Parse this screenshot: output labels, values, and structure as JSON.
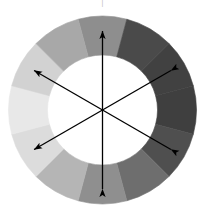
{
  "figure": {
    "top_mark": "|",
    "background_color": "#ffffff",
    "center": {
      "x": 102.5,
      "y": 110.0
    },
    "outer_radius": 94.0,
    "inner_radius": 55.0,
    "segment_count": 12,
    "segment_span_degrees": 30,
    "first_segment_start_degrees": -105
  },
  "chart_data": {
    "type": "pie",
    "xlabel": "",
    "ylabel": "",
    "legend_position": "none",
    "grid": false,
    "inner_radius_fraction": 0.585,
    "categories": [
      "segment-1",
      "segment-2",
      "segment-3",
      "segment-4",
      "segment-5",
      "segment-6",
      "segment-7",
      "segment-8",
      "segment-9",
      "segment-10",
      "segment-11",
      "segment-12"
    ],
    "values": [
      30,
      30,
      30,
      30,
      30,
      30,
      30,
      30,
      30,
      30,
      30,
      30
    ],
    "segments": [
      {
        "name": "segment-1",
        "index": 1,
        "start_deg": -105,
        "end_deg": -75,
        "clock_position": "12 o'clock",
        "color": "#8e8e8e",
        "gray_level": 142
      },
      {
        "name": "segment-2",
        "index": 2,
        "start_deg": -75,
        "end_deg": -45,
        "clock_position": "1 o'clock",
        "color": "#4a4a4a",
        "gray_level": 74
      },
      {
        "name": "segment-3",
        "index": 3,
        "start_deg": -45,
        "end_deg": -15,
        "clock_position": "2 o'clock",
        "color": "#414141",
        "gray_level": 65
      },
      {
        "name": "segment-4",
        "index": 4,
        "start_deg": -15,
        "end_deg": 15,
        "clock_position": "3 o'clock",
        "color": "#3f3f3f",
        "gray_level": 63
      },
      {
        "name": "segment-5",
        "index": 5,
        "start_deg": 15,
        "end_deg": 45,
        "clock_position": "4 o'clock",
        "color": "#4f4f4f",
        "gray_level": 79
      },
      {
        "name": "segment-6",
        "index": 6,
        "start_deg": 45,
        "end_deg": 75,
        "clock_position": "5 o'clock",
        "color": "#6e6e6e",
        "gray_level": 110
      },
      {
        "name": "segment-7",
        "index": 7,
        "start_deg": 75,
        "end_deg": 105,
        "clock_position": "6 o'clock",
        "color": "#8f8f8f",
        "gray_level": 143
      },
      {
        "name": "segment-8",
        "index": 8,
        "start_deg": 105,
        "end_deg": 135,
        "clock_position": "7 o'clock",
        "color": "#b5b5b5",
        "gray_level": 181
      },
      {
        "name": "segment-9",
        "index": 9,
        "start_deg": 135,
        "end_deg": 165,
        "clock_position": "8 o'clock",
        "color": "#dcdcdc",
        "gray_level": 220
      },
      {
        "name": "segment-10",
        "index": 10,
        "start_deg": 165,
        "end_deg": 195,
        "clock_position": "9 o'clock",
        "color": "#e8e8e8",
        "gray_level": 232
      },
      {
        "name": "segment-11",
        "index": 11,
        "start_deg": 195,
        "end_deg": 225,
        "clock_position": "10 o'clock",
        "color": "#d2d2d2",
        "gray_level": 210
      },
      {
        "name": "segment-12",
        "index": 12,
        "start_deg": 225,
        "end_deg": 255,
        "clock_position": "11 o'clock",
        "color": "#a8a8a8",
        "gray_level": 168
      }
    ],
    "axes": [
      {
        "name": "vertical-axis",
        "angle_deg": 90,
        "label": "",
        "double_headed": true
      },
      {
        "name": "upper-right-axis",
        "angle_deg": 30,
        "label": "",
        "double_headed": true
      },
      {
        "name": "lower-right-axis",
        "angle_deg": 330,
        "label": "",
        "double_headed": true
      }
    ],
    "axis_color": "#000000",
    "axis_length_radius": 79,
    "annotations": []
  }
}
